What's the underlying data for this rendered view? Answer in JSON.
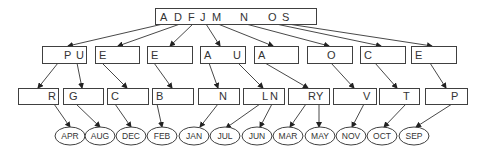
{
  "diagram": {
    "root": {
      "keys": [
        "A",
        "D",
        "F",
        "J",
        "M",
        "N",
        "O",
        "S"
      ],
      "x": 155,
      "y": 8,
      "w": 161,
      "h": 16,
      "key_x": [
        160,
        174,
        188,
        200,
        212,
        240,
        268,
        282
      ]
    },
    "level2": [
      {
        "keys": [
          {
            "t": "P",
            "dx": 22
          },
          {
            "t": "U",
            "dx": 34
          }
        ],
        "x": 42,
        "w": 44
      },
      {
        "keys": [
          {
            "t": "E",
            "dx": 4
          }
        ],
        "x": 95,
        "w": 44
      },
      {
        "keys": [
          {
            "t": "E",
            "dx": 4
          }
        ],
        "x": 147,
        "w": 45
      },
      {
        "keys": [
          {
            "t": "A",
            "dx": 4
          },
          {
            "t": "U",
            "dx": 33
          }
        ],
        "x": 200,
        "w": 45
      },
      {
        "keys": [
          {
            "t": "A",
            "dx": 4
          }
        ],
        "x": 254,
        "w": 44
      },
      {
        "keys": [
          {
            "t": "O",
            "dx": 20
          }
        ],
        "x": 307,
        "w": 45
      },
      {
        "keys": [
          {
            "t": "C",
            "dx": 4
          }
        ],
        "x": 360,
        "w": 45
      },
      {
        "keys": [
          {
            "t": "E",
            "dx": 4
          }
        ],
        "x": 411,
        "w": 45
      }
    ],
    "level2_y": 46,
    "level2_h": 17,
    "level3": [
      {
        "keys": [
          {
            "t": "R",
            "dx": 30
          }
        ],
        "x": 18,
        "w": 40
      },
      {
        "keys": [
          {
            "t": "G",
            "dx": 6
          }
        ],
        "x": 63,
        "w": 40
      },
      {
        "keys": [
          {
            "t": "C",
            "dx": 4
          }
        ],
        "x": 107,
        "w": 41
      },
      {
        "keys": [
          {
            "t": "B",
            "dx": 4
          }
        ],
        "x": 152,
        "w": 41
      },
      {
        "keys": [
          {
            "t": "N",
            "dx": 21
          }
        ],
        "x": 198,
        "w": 41
      },
      {
        "keys": [
          {
            "t": "L",
            "dx": 19
          },
          {
            "t": "N",
            "dx": 27
          }
        ],
        "x": 243,
        "w": 41
      },
      {
        "keys": [
          {
            "t": "R",
            "dx": 20
          },
          {
            "t": "Y",
            "dx": 28
          }
        ],
        "x": 288,
        "w": 41
      },
      {
        "keys": [
          {
            "t": "V",
            "dx": 30
          }
        ],
        "x": 333,
        "w": 43
      },
      {
        "keys": [
          {
            "t": "T",
            "dx": 24
          }
        ],
        "x": 379,
        "w": 40
      },
      {
        "keys": [
          {
            "t": "P",
            "dx": 26
          }
        ],
        "x": 425,
        "w": 42
      }
    ],
    "level3_y": 88,
    "level3_h": 16,
    "leaves": [
      {
        "label": "APR",
        "cx": 70
      },
      {
        "label": "AUG",
        "cx": 100
      },
      {
        "label": "DEC",
        "cx": 131
      },
      {
        "label": "FEB",
        "cx": 162
      },
      {
        "label": "JAN",
        "cx": 194
      },
      {
        "label": "JUL",
        "cx": 225
      },
      {
        "label": "JUN",
        "cx": 257
      },
      {
        "label": "MAR",
        "cx": 288
      },
      {
        "label": "MAY",
        "cx": 320
      },
      {
        "label": "NOV",
        "cx": 351
      },
      {
        "label": "OCT",
        "cx": 382
      },
      {
        "label": "SEP",
        "cx": 414
      }
    ],
    "leaf_cy": 136,
    "leaf_rx": 15,
    "leaf_ry": 9,
    "edges_root_to_l2": [
      [
        [
          163,
          24
        ],
        [
          68,
          46
        ]
      ],
      [
        [
          180,
          24
        ],
        [
          118,
          46
        ]
      ],
      [
        [
          193,
          24
        ],
        [
          170,
          46
        ]
      ],
      [
        [
          206,
          24
        ],
        [
          220,
          46
        ]
      ],
      [
        [
          218,
          24
        ],
        [
          273,
          46
        ]
      ],
      [
        [
          246,
          24
        ],
        [
          329,
          46
        ]
      ],
      [
        [
          276,
          24
        ],
        [
          381,
          46
        ]
      ],
      [
        [
          288,
          24
        ],
        [
          432,
          46
        ]
      ]
    ],
    "edges_l2_to_l3": [
      [
        [
          58,
          63
        ],
        [
          38,
          88
        ]
      ],
      [
        [
          77,
          63
        ],
        [
          82,
          88
        ]
      ],
      [
        [
          102,
          63
        ],
        [
          127,
          88
        ]
      ],
      [
        [
          154,
          63
        ],
        [
          172,
          88
        ]
      ],
      [
        [
          209,
          63
        ],
        [
          218,
          88
        ]
      ],
      [
        [
          238,
          63
        ],
        [
          263,
          88
        ]
      ],
      [
        [
          265,
          63
        ],
        [
          308,
          88
        ]
      ],
      [
        [
          331,
          63
        ],
        [
          354,
          88
        ]
      ],
      [
        [
          375,
          63
        ],
        [
          397,
          88
        ]
      ],
      [
        [
          430,
          63
        ],
        [
          446,
          88
        ]
      ]
    ],
    "edges_l3_to_leaf": [
      [
        [
          54,
          104
        ],
        [
          70,
          127
        ]
      ],
      [
        [
          76,
          104
        ],
        [
          100,
          127
        ]
      ],
      [
        [
          115,
          104
        ],
        [
          131,
          127
        ]
      ],
      [
        [
          157,
          104
        ],
        [
          162,
          127
        ]
      ],
      [
        [
          218,
          104
        ],
        [
          200,
          127
        ]
      ],
      [
        [
          260,
          104
        ],
        [
          226,
          128
        ]
      ],
      [
        [
          272,
          104
        ],
        [
          260,
          127
        ]
      ],
      [
        [
          306,
          104
        ],
        [
          290,
          127
        ]
      ],
      [
        [
          319,
          104
        ],
        [
          319,
          127
        ]
      ],
      [
        [
          364,
          104
        ],
        [
          352,
          127
        ]
      ],
      [
        [
          406,
          104
        ],
        [
          384,
          127
        ]
      ],
      [
        [
          452,
          104
        ],
        [
          416,
          127
        ]
      ]
    ]
  }
}
